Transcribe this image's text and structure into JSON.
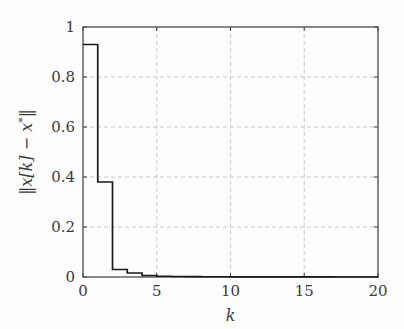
{
  "chart_data": {
    "type": "line",
    "line_style": "step-post",
    "title": "",
    "xlabel": "k",
    "ylabel": "‖x[k] − x*‖",
    "ylabel_parts": {
      "prefix": "‖",
      "var1": "x",
      "index": "[k]",
      "minus": " − ",
      "var2": "x",
      "star": "*",
      "suffix": "‖"
    },
    "xlim": [
      0,
      20
    ],
    "ylim": [
      0,
      1
    ],
    "xticks": [
      0,
      5,
      10,
      15,
      20
    ],
    "xtick_labels": [
      "0",
      "5",
      "10",
      "15",
      "20"
    ],
    "yticks": [
      0,
      0.2,
      0.4,
      0.6,
      0.8,
      1
    ],
    "ytick_labels": [
      "0",
      "0.2",
      "0.4",
      "0.6",
      "0.8",
      "1"
    ],
    "grid": true,
    "grid_style": "dashed",
    "grid_color": "#c8c8c8",
    "legend": null,
    "line_color": "#1a1a1a",
    "line_width": 1.6,
    "background_color": "#fdfdfd",
    "axis_color": "#4a4a4a",
    "x": [
      0,
      1,
      2,
      3,
      4,
      5,
      6,
      7,
      8,
      9,
      10,
      11,
      12,
      13,
      14,
      15,
      16,
      17,
      18,
      19,
      20
    ],
    "y": [
      0.93,
      0.38,
      0.03,
      0.016,
      0.006,
      0.003,
      0.002,
      0.0015,
      0.001,
      0.001,
      0.0008,
      0.0006,
      0.0005,
      0.0004,
      0.0003,
      0.0002,
      0.0002,
      0.0001,
      0.0001,
      0.0001,
      0.0
    ],
    "series": [
      {
        "name": "‖x[k] − x*‖",
        "values": [
          0.93,
          0.38,
          0.03,
          0.016,
          0.006,
          0.003,
          0.002,
          0.0015,
          0.001,
          0.001,
          0.0008,
          0.0006,
          0.0005,
          0.0004,
          0.0003,
          0.0002,
          0.0002,
          0.0001,
          0.0001,
          0.0001,
          0.0
        ]
      }
    ]
  },
  "geometry": {
    "plot_left": 83,
    "plot_right": 378,
    "plot_top": 27,
    "plot_bottom": 277
  }
}
